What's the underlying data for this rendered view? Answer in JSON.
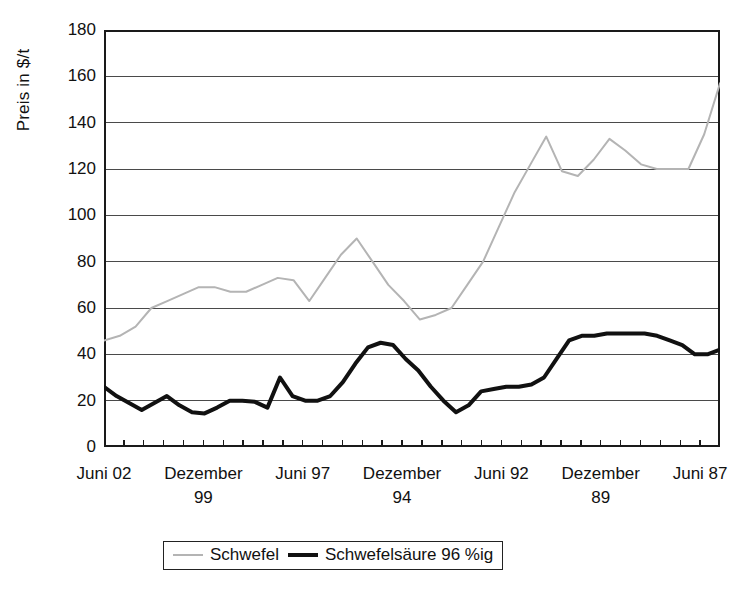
{
  "chart_data": {
    "type": "line",
    "title": "",
    "xlabel": "",
    "ylabel": "Preis in $/t",
    "ylim": [
      0,
      180
    ],
    "ytick_step": 20,
    "yticks": [
      180,
      160,
      140,
      120,
      100,
      80,
      60,
      40,
      20,
      0
    ],
    "grid": "horizontal",
    "legend_position": "bottom-center",
    "xtick_labels": [
      {
        "line1": "Juni 02",
        "line2": "",
        "index": 0
      },
      {
        "line1": "Dezember",
        "line2": "99",
        "index": 5
      },
      {
        "line1": "Juni 97",
        "line2": "",
        "index": 10
      },
      {
        "line1": "Dezember",
        "line2": "94",
        "index": 15
      },
      {
        "line1": "Juni 92",
        "line2": "",
        "index": 20
      },
      {
        "line1": "Dezember",
        "line2": "89",
        "index": 25
      },
      {
        "line1": "Juni 87",
        "line2": "",
        "index": 30
      }
    ],
    "x_count": 32,
    "series": [
      {
        "name": "Schwefel",
        "color": "#b4b4b4",
        "width": 2,
        "values": [
          46,
          48,
          52,
          60,
          63,
          66,
          69,
          69,
          67,
          67,
          70,
          73,
          72,
          63,
          73,
          83,
          90,
          80,
          70,
          63,
          55,
          57,
          60,
          70,
          80,
          95,
          110,
          122,
          134,
          119,
          117,
          124,
          133,
          128,
          122,
          120,
          120,
          120,
          135,
          157
        ]
      },
      {
        "name": "Schwefelsäure 96 %ig",
        "color": "#111111",
        "width": 4,
        "values": [
          26,
          22,
          19,
          16,
          19,
          22,
          18,
          15,
          14.5,
          17,
          20,
          20,
          19.5,
          17,
          30,
          22,
          20,
          20,
          22,
          28,
          36,
          43,
          45,
          44,
          38,
          33,
          26,
          20,
          15,
          18,
          24,
          25,
          26,
          26,
          27,
          30,
          38,
          46,
          48,
          48,
          49,
          49,
          49,
          49,
          48,
          46,
          44,
          40,
          40,
          42
        ]
      }
    ]
  },
  "legend": {
    "items": [
      {
        "label": "Schwefel",
        "color": "#b4b4b4"
      },
      {
        "label": "Schwefelsäure 96 %ig",
        "color": "#111111"
      }
    ]
  }
}
